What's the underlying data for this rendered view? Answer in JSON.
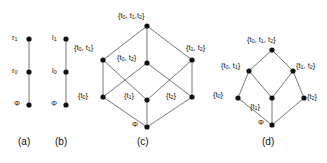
{
  "figure": {
    "background": "#ffffff",
    "node_color": "#111111",
    "edge_color": "#555555"
  },
  "panels": [
    {
      "id": "a",
      "caption": "(a)",
      "caption_pos": {
        "x": 18,
        "y": 136
      },
      "type": "chain",
      "nodes": [
        {
          "key": "a_top",
          "label": "r₁",
          "label_html": "r<span class='sub'>1</span>",
          "x": 29,
          "y": 39,
          "label_x": 12,
          "label_y": 34
        },
        {
          "key": "a_mid",
          "label": "r₀",
          "label_html": "r<span class='sub'>0</span>",
          "x": 29,
          "y": 72,
          "label_x": 12,
          "label_y": 67
        },
        {
          "key": "a_bot",
          "label": "Φ",
          "label_html": "Φ",
          "x": 29,
          "y": 105,
          "label_x": 14,
          "label_y": 100
        }
      ],
      "edges": [
        [
          "a_top",
          "a_mid"
        ],
        [
          "a_mid",
          "a_bot"
        ]
      ]
    },
    {
      "id": "b",
      "caption": "(b)",
      "caption_pos": {
        "x": 55,
        "y": 136
      },
      "type": "chain",
      "nodes": [
        {
          "key": "b_top",
          "label": "l₁",
          "label_html": "l<span class='sub'>1</span>",
          "x": 66,
          "y": 39,
          "label_x": 52,
          "label_y": 34
        },
        {
          "key": "b_mid",
          "label": "l₀",
          "label_html": "l<span class='sub'>0</span>",
          "x": 66,
          "y": 72,
          "label_x": 52,
          "label_y": 67
        },
        {
          "key": "b_bot",
          "label": "Φ",
          "label_html": "Φ",
          "x": 66,
          "y": 105,
          "label_x": 51,
          "label_y": 100
        }
      ],
      "edges": [
        [
          "b_top",
          "b_mid"
        ],
        [
          "b_mid",
          "b_bot"
        ]
      ]
    },
    {
      "id": "c",
      "caption": "(c)",
      "caption_pos": {
        "x": 137,
        "y": 136
      },
      "type": "boolean-lattice-cube",
      "nodes": [
        {
          "key": "c_top",
          "label": "{t₀, t₁,t₂}",
          "label_html": "{t<span class='sub'>0</span>, t<span class='sub'>1</span>,t<span class='sub'>2</span>}",
          "x": 147,
          "y": 26,
          "label_x": 118,
          "label_y": 12
        },
        {
          "key": "c_t0t1",
          "label": "{t₀, t₁}",
          "label_html": "{t<span class='sub'>0</span>, t<span class='sub'>1</span>}",
          "x": 103,
          "y": 60,
          "label_x": 74,
          "label_y": 44
        },
        {
          "key": "c_t0t2",
          "label": "{t₀, t₂}",
          "label_html": "{t<span class='sub'>0</span>, t<span class='sub'>2</span>}",
          "x": 147,
          "y": 63,
          "label_x": 117,
          "label_y": 54
        },
        {
          "key": "c_t1t2",
          "label": "{t₁, t₂}",
          "label_html": "{t<span class='sub'>1</span>, t<span class='sub'>2</span>}",
          "x": 192,
          "y": 60,
          "label_x": 186,
          "label_y": 44
        },
        {
          "key": "c_t0",
          "label": "{t₀}",
          "label_html": "{t<span class='sub'>0</span>}",
          "x": 103,
          "y": 97,
          "label_x": 78,
          "label_y": 92
        },
        {
          "key": "c_t1",
          "label": "{t₁}",
          "label_html": "{t<span class='sub'>1</span>}",
          "x": 147,
          "y": 100,
          "label_x": 124,
          "label_y": 92
        },
        {
          "key": "c_t2",
          "label": "{t₂}",
          "label_html": "{t<span class='sub'>2</span>}",
          "x": 192,
          "y": 97,
          "label_x": 166,
          "label_y": 92
        },
        {
          "key": "c_bot",
          "label": "Φ",
          "label_html": "Φ",
          "x": 147,
          "y": 127,
          "label_x": 132,
          "label_y": 121
        }
      ],
      "edges": [
        [
          "c_top",
          "c_t0t1"
        ],
        [
          "c_top",
          "c_t0t2"
        ],
        [
          "c_top",
          "c_t1t2"
        ],
        [
          "c_t0t1",
          "c_t0"
        ],
        [
          "c_t0t1",
          "c_t1"
        ],
        [
          "c_t0t2",
          "c_t0"
        ],
        [
          "c_t0t2",
          "c_t2"
        ],
        [
          "c_t1t2",
          "c_t1"
        ],
        [
          "c_t1t2",
          "c_t2"
        ],
        [
          "c_t0",
          "c_bot"
        ],
        [
          "c_t1",
          "c_bot"
        ],
        [
          "c_t2",
          "c_bot"
        ]
      ]
    },
    {
      "id": "d",
      "caption": "(d)",
      "caption_pos": {
        "x": 262,
        "y": 136
      },
      "type": "sublattice",
      "nodes": [
        {
          "key": "d_top",
          "label": "{t₀, t₁, t₂}",
          "label_html": "{t<span class='sub'>0</span>, t<span class='sub'>1</span>, t<span class='sub'>2</span>}",
          "x": 272,
          "y": 50,
          "label_x": 247,
          "label_y": 36
        },
        {
          "key": "d_t0t1",
          "label": "{t₀, t₁}",
          "label_html": "{t<span class='sub'>0</span>, t<span class='sub'>1</span>}",
          "x": 249,
          "y": 71,
          "label_x": 221,
          "label_y": 62
        },
        {
          "key": "d_t1t2",
          "label": "{t₁, t₂}",
          "label_html": "{t<span class='sub'>1</span>, t<span class='sub'>2</span>}",
          "x": 293,
          "y": 71,
          "label_x": 296,
          "label_y": 62
        },
        {
          "key": "d_t0",
          "label": "{t₀}",
          "label_html": "{t<span class='sub'>0</span>}",
          "x": 238,
          "y": 98,
          "label_x": 213,
          "label_y": 91
        },
        {
          "key": "d_t1",
          "label": "{t₁}",
          "label_html": "{t<span class='sub'>1</span>}",
          "x": 272,
          "y": 98,
          "label_x": 250,
          "label_y": 103
        },
        {
          "key": "d_t2",
          "label": "{t₂}",
          "label_html": "{t<span class='sub'>2</span>}",
          "x": 304,
          "y": 98,
          "label_x": 307,
          "label_y": 93
        },
        {
          "key": "d_bot",
          "label": "Φ",
          "label_html": "Φ",
          "x": 272,
          "y": 125,
          "label_x": 258,
          "label_y": 119
        }
      ],
      "edges": [
        [
          "d_top",
          "d_t0t1"
        ],
        [
          "d_top",
          "d_t1t2"
        ],
        [
          "d_t0t1",
          "d_t0"
        ],
        [
          "d_t0t1",
          "d_t1"
        ],
        [
          "d_t1t2",
          "d_t1"
        ],
        [
          "d_t1t2",
          "d_t2"
        ],
        [
          "d_t0",
          "d_bot"
        ],
        [
          "d_t1",
          "d_bot"
        ],
        [
          "d_t2",
          "d_bot"
        ]
      ]
    }
  ]
}
